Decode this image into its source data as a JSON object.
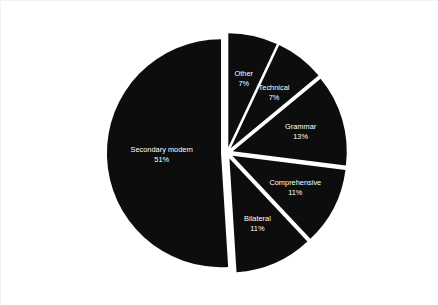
{
  "chart_data": {
    "type": "pie",
    "title": "",
    "subtitle": "",
    "xlabel": "",
    "ylabel": "",
    "legend_position": "none",
    "grid": false,
    "labels_inside_slices": true,
    "start_angle_deg": 0,
    "direction": "clockwise",
    "categories": [
      "Other",
      "Technical",
      "Grammar",
      "Comprehensive",
      "Bilateral",
      "Secondary modern"
    ],
    "values": [
      7,
      7,
      13,
      11,
      11,
      51
    ],
    "value_unit": "%",
    "slices": [
      {
        "label": "Other",
        "value": 7,
        "value_text": "7%",
        "color": "#0d0d0d",
        "exploded": true
      },
      {
        "label": "Technical",
        "value": 7,
        "value_text": "7%",
        "color": "#0d0d0d",
        "exploded": true
      },
      {
        "label": "Grammar",
        "value": 13,
        "value_text": "13%",
        "color": "#0d0d0d",
        "exploded": true
      },
      {
        "label": "Comprehensive",
        "value": 11,
        "value_text": "11%",
        "color": "#0d0d0d",
        "exploded": true
      },
      {
        "label": "Bilateral",
        "value": 11,
        "value_text": "11%",
        "color": "#0d0d0d",
        "exploded": true
      },
      {
        "label": "Secondary modern",
        "value": 51,
        "value_text": "51%",
        "color": "#0d0d0d",
        "exploded": true
      }
    ],
    "colors": {
      "slice_fill": "#0d0d0d",
      "label_text": "#ffffff",
      "background": "#ffffff",
      "border": "#f2f2f2"
    },
    "geometry": {
      "center_x": 226,
      "center_y": 152,
      "radius": 114,
      "explode_offset": 6
    }
  }
}
